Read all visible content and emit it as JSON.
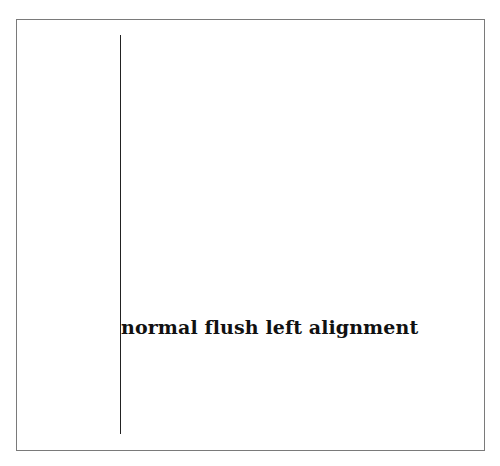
{
  "figure": {
    "text": "normal flush left alignment",
    "alignment": "flush-left",
    "colors": {
      "frame_border": "#7a7a7a",
      "rule": "#222222",
      "text": "#111111",
      "background": "#ffffff"
    }
  }
}
